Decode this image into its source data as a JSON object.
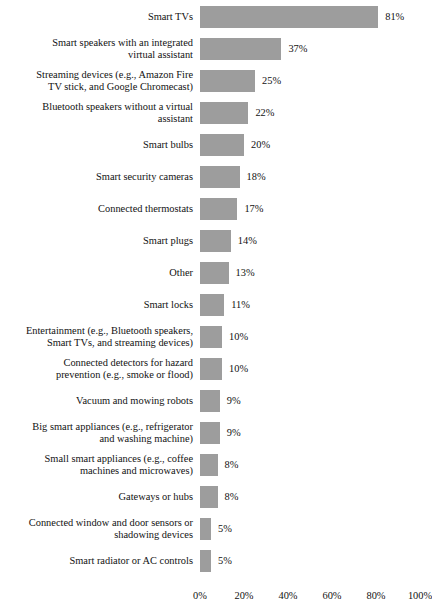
{
  "chart_data": {
    "type": "bar",
    "orientation": "horizontal",
    "title": "",
    "subtitle": "",
    "xlabel": "",
    "ylabel": "",
    "xlim": [
      0,
      100
    ],
    "grid": false,
    "legend": null,
    "bar_color": "#9d9d9d",
    "value_suffix": "%",
    "tick_labels": [
      "0%",
      "20%",
      "40%",
      "60%",
      "80%",
      "100%"
    ],
    "ticks": [
      0,
      20,
      40,
      60,
      80,
      100
    ],
    "categories": [
      "Smart TVs",
      "Smart speakers with an integrated\nvirtual assistant",
      "Streaming devices (e.g., Amazon Fire\nTV stick, and Google Chromecast)",
      "Bluetooth speakers without a virtual\nassistant",
      "Smart bulbs",
      "Smart security cameras",
      "Connected thermostats",
      "Smart plugs",
      "Other",
      "Smart locks",
      "Entertainment (e.g., Bluetooth speakers,\nSmart TVs, and streaming devices)",
      "Connected detectors for hazard\nprevention (e.g., smoke or flood)",
      "Vacuum and mowing robots",
      "Big smart appliances (e.g., refrigerator\nand washing machine)",
      "Small smart appliances (e.g., coffee\nmachines and microwaves)",
      "Gateways or hubs",
      "Connected window and door sensors or\nshadowing devices",
      "Smart radiator or AC controls"
    ],
    "values": [
      81,
      37,
      25,
      22,
      20,
      18,
      17,
      14,
      13,
      11,
      10,
      10,
      9,
      9,
      8,
      8,
      5,
      5
    ],
    "value_labels": [
      "81%",
      "37%",
      "25%",
      "22%",
      "20%",
      "18%",
      "17%",
      "14%",
      "13%",
      "11%",
      "10%",
      "10%",
      "9%",
      "9%",
      "8%",
      "8%",
      "5%",
      "5%"
    ]
  }
}
